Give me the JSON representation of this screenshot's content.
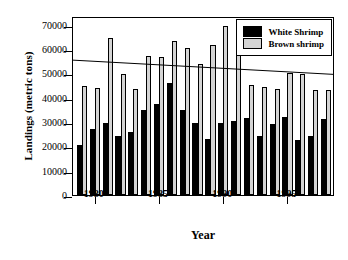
{
  "chart_data": {
    "type": "bar",
    "title": "",
    "xlabel": "Year",
    "ylabel": "Landings (metric tons)",
    "xlim": [
      1978.3,
      1998.7
    ],
    "ylim": [
      0,
      73500
    ],
    "ytick_values": [
      0,
      10000,
      20000,
      30000,
      40000,
      50000,
      60000,
      70000
    ],
    "ytick_labels": [
      "0",
      "10000",
      "20000",
      "30000",
      "40000",
      "50000",
      "60000",
      "70000"
    ],
    "xtick_values": [
      1980,
      1985,
      1990,
      1995
    ],
    "xtick_labels": [
      "1980",
      "1985",
      "1990",
      "1995"
    ],
    "grid": false,
    "legend_position": "top-right",
    "categories": [
      1979,
      1980,
      1981,
      1982,
      1983,
      1984,
      1985,
      1986,
      1987,
      1988,
      1989,
      1990,
      1991,
      1992,
      1993,
      1994,
      1995,
      1996,
      1997,
      1998
    ],
    "series": [
      {
        "name": "White Shrimp",
        "color": "#000000",
        "values": [
          20700,
          27200,
          29700,
          24300,
          26000,
          34800,
          37500,
          46100,
          34900,
          29500,
          22800,
          29500,
          30400,
          31600,
          24300,
          29300,
          31900,
          22400,
          24400,
          31300
        ]
      },
      {
        "name": "Brown shrimp",
        "color": "#d4d4d4",
        "values": [
          44600,
          44000,
          64300,
          49700,
          43500,
          57000,
          56800,
          63100,
          60500,
          54000,
          61600,
          69500,
          57600,
          45100,
          44300,
          43500,
          50200,
          49700,
          43200,
          43100
        ]
      }
    ],
    "trendline": {
      "label": "",
      "x_start": 1978.3,
      "y_start": 56000,
      "x_end": 1998.7,
      "y_end": 50100
    }
  },
  "legend": {
    "items": [
      {
        "label": "White Shrimp",
        "swatch": "white-shrimp-swatch"
      },
      {
        "label": "Brown shrimp",
        "swatch": "brown-shrimp-swatch"
      }
    ]
  }
}
